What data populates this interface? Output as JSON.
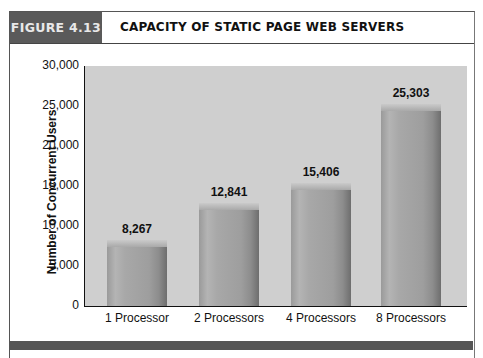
{
  "figure": {
    "number_label": "FIGURE 4.13",
    "title": "CAPACITY OF STATIC PAGE WEB SERVERS"
  },
  "chart_data": {
    "type": "bar",
    "title": "CAPACITY OF STATIC PAGE WEB SERVERS",
    "xlabel": "",
    "ylabel": "Number of Concurrent Users",
    "categories": [
      "1 Processor",
      "2 Processors",
      "4 Processors",
      "8 Processors"
    ],
    "values": [
      8267,
      12841,
      15406,
      25303
    ],
    "value_labels": [
      "8,267",
      "12,841",
      "15,406",
      "25,303"
    ],
    "ylim": [
      0,
      30000
    ],
    "yticks": [
      "0",
      "5,000",
      "10,000",
      "15,000",
      "20,000",
      "25,000",
      "30,000"
    ],
    "grid": false,
    "legend": null
  },
  "colors": {
    "figure_tab": "#5a5a5a",
    "plot_background": "#cfcfcf",
    "bar": "#a0a0a0",
    "bottom_band": "#555555"
  }
}
